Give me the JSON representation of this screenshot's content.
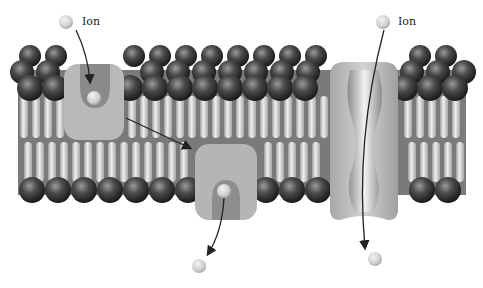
{
  "diagram": {
    "type": "cell membrane ion transport illustration",
    "labels": {
      "ion_left": "Ion",
      "ion_right": "Ion"
    },
    "components": {
      "lipid_bilayer": "phospholipid bilayer with spherical heads and tails",
      "carrier_protein_open_outside": "carrier protein (ion binding from outside)",
      "carrier_protein_open_inside": "carrier protein (ion released inside)",
      "channel_protein": "ion channel protein"
    },
    "colors": {
      "background": "#ffffff",
      "lipid_head": "#3a3a3a",
      "lipid_tail": "#d8d8d8",
      "bilayer_core": "#7a7a7a",
      "protein": "#b8b8b8",
      "ion": "#d6d6d6",
      "arrow": "#222222"
    }
  }
}
